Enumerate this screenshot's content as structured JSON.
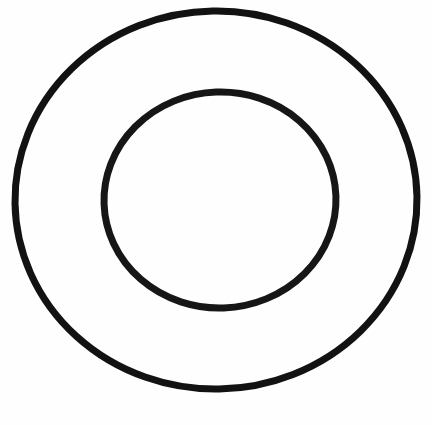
{
  "canvas": {
    "width": 432,
    "height": 425,
    "background_color": "#fefefe",
    "description": "Scanned line drawing of two concentric circles forming an annulus"
  },
  "figure": {
    "name": "concentric-circles",
    "kind": "annulus",
    "stroke_color": "#121212",
    "text_content": "",
    "shapes": [
      {
        "id": "outer-circle",
        "label": "outer-circle",
        "center_x": 216,
        "center_y": 200,
        "radius_x": 201,
        "radius_y": 189,
        "stroke_width": 7,
        "stroke_color": "#121212",
        "fill": "none",
        "rotation": -1
      },
      {
        "id": "inner-circle",
        "label": "inner-circle",
        "center_x": 220,
        "center_y": 200,
        "radius_x": 116,
        "radius_y": 108,
        "stroke_width": 7,
        "stroke_color": "#161616",
        "fill": "none",
        "rotation": -2
      }
    ]
  }
}
